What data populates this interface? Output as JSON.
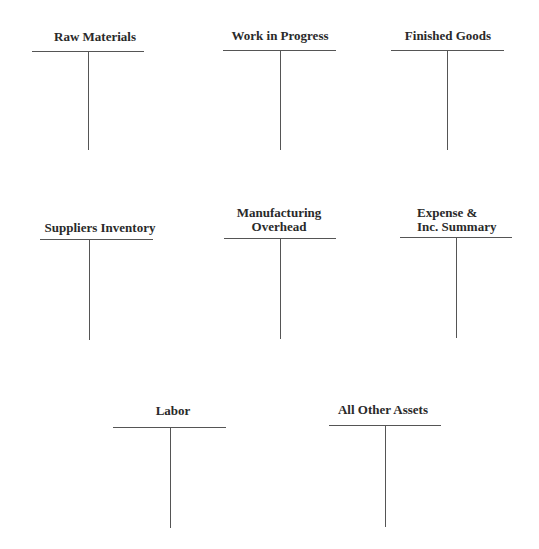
{
  "worksheet": {
    "accounts": [
      {
        "name": "Raw Materials",
        "lines": [
          "Raw Materials"
        ]
      },
      {
        "name": "Work in Progress",
        "lines": [
          "Work in Progress"
        ]
      },
      {
        "name": "Finished Goods",
        "lines": [
          "Finished Goods"
        ]
      },
      {
        "name": "Suppliers Inventory",
        "lines": [
          "Suppliers Inventory"
        ]
      },
      {
        "name": "Manufacturing Overhead",
        "lines": [
          "Manufacturing",
          "Overhead"
        ]
      },
      {
        "name": "Expense & Inc. Summary",
        "lines": [
          "Expense &",
          "Inc. Summary"
        ]
      },
      {
        "name": "Labor",
        "lines": [
          "Labor"
        ]
      },
      {
        "name": "All Other Assets",
        "lines": [
          "All Other Assets"
        ]
      }
    ]
  },
  "colors": {
    "line": "#555555",
    "text": "#2a2a2a",
    "background": "#ffffff"
  }
}
